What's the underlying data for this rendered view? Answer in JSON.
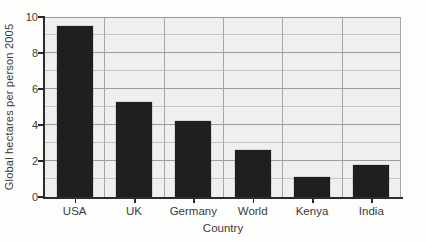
{
  "chart_data": {
    "type": "bar",
    "title": "",
    "categories": [
      "USA",
      "UK",
      "Germany",
      "World",
      "Kenya",
      "India"
    ],
    "values": [
      9.5,
      5.3,
      4.2,
      2.6,
      1.1,
      1.8
    ],
    "xlabel": "Country",
    "ylabel": "Global hectares per person 2005",
    "ylim": [
      0,
      10
    ],
    "yticks": [
      0,
      2,
      4,
      6,
      8,
      10
    ],
    "grid_step": 1,
    "grid": "on",
    "legend": "none",
    "bar_color": "#201e1e",
    "plot_bg_color": "#f0efed",
    "grid_major_color": "#9c9c9a",
    "grid_minor_color": "#c3c3c0",
    "axis_color": "#2b2b2b",
    "text_color": "#3b3b3b"
  }
}
